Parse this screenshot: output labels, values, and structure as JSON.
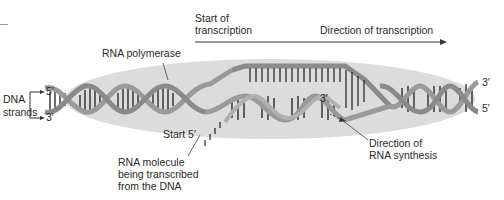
{
  "diagram": {
    "labels": {
      "start_of_transcription": [
        "Start of",
        "transcription"
      ],
      "direction_of_transcription": "Direction of transcription",
      "rna_polymerase": "RNA polymerase",
      "dna_strands": [
        "DNA",
        "strands"
      ],
      "left_top_end": "5′",
      "left_bottom_end": "3′",
      "right_top_end": "3′",
      "right_bottom_end": "5′",
      "rna_3_end": "3′",
      "start_5": "Start 5′",
      "rna_molecule": [
        "RNA molecule",
        "being transcribed",
        "from the DNA"
      ],
      "direction_rna_synthesis": [
        "Direction of",
        "RNA synthesis"
      ]
    },
    "colors": {
      "polymerase_fill": "#d9d9d9",
      "strand": "#9a9a9a",
      "strand_dark": "#7a7a7a",
      "base_pair": "#1e1e1e",
      "text": "#2a2a2a"
    }
  }
}
